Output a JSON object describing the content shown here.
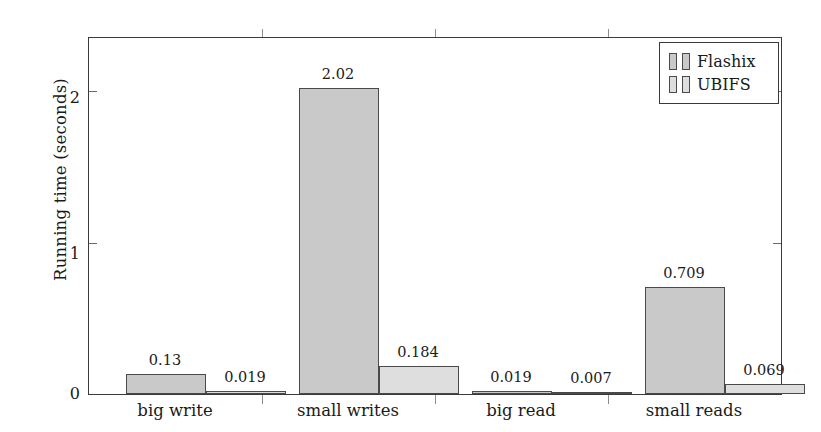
{
  "chart_data": {
    "type": "bar",
    "title": "",
    "xlabel": "",
    "ylabel": "Running time (seconds)",
    "categories": [
      "big write",
      "small writes",
      "big read",
      "small reads"
    ],
    "series": [
      {
        "name": "Flashix",
        "color": "#c9c9c9",
        "values": [
          0.13,
          2.02,
          0.019,
          0.709
        ],
        "value_labels": [
          "0.13",
          "2.02",
          "0.019",
          "0.709"
        ]
      },
      {
        "name": "UBIFS",
        "color": "#dedede",
        "values": [
          0.019,
          0.184,
          0.007,
          0.069
        ],
        "value_labels": [
          "0.019",
          "0.184",
          "0.007",
          "0.069"
        ]
      }
    ],
    "ylim": [
      0,
      2.35
    ],
    "yticks": [
      0,
      1,
      2
    ],
    "ytick_labels": [
      "0",
      "1",
      "2"
    ],
    "grid": false,
    "legend_position": "top-right",
    "legend_entries": [
      "Flashix",
      "UBIFS"
    ]
  },
  "axes": {
    "y_title": "Running time (seconds)",
    "ytick_0": "0",
    "ytick_1": "1",
    "ytick_2": "2"
  },
  "categories": {
    "c0": "big write",
    "c1": "small writes",
    "c2": "big read",
    "c3": "small reads"
  },
  "values": {
    "f0": "0.13",
    "u0": "0.019",
    "f1": "2.02",
    "u1": "0.184",
    "f2": "0.019",
    "u2": "0.007",
    "f3": "0.709",
    "u3": "0.069"
  },
  "legend": {
    "flashix": "Flashix",
    "ubifs": "UBIFS"
  },
  "colors": {
    "flashix": "#c9c9c9",
    "ubifs": "#dedede",
    "frame": "#3a3a3a",
    "text": "#1a1a1a"
  }
}
